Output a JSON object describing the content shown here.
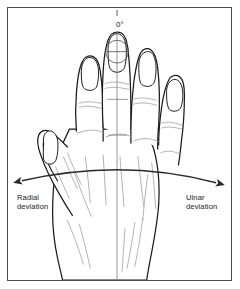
{
  "figure": {
    "type": "anatomical-line-drawing",
    "background_color": "#ffffff",
    "frame_color": "#4a4a4a",
    "ink_color": "#1a1a1a",
    "sketch_color": "#8c8c8c"
  },
  "annotations": {
    "neutral_angle": "0°",
    "radial": {
      "line1": "Radial",
      "line2": "deviation",
      "text": "Radial\ndeviation"
    },
    "ulnar": {
      "line1": "Ulnar",
      "line2": "deviation",
      "text": "Ulnar\ndeviation"
    }
  },
  "axes": {
    "vertical_reference_label": "0°",
    "arrow_left_direction": "radial",
    "arrow_right_direction": "ulnar"
  }
}
